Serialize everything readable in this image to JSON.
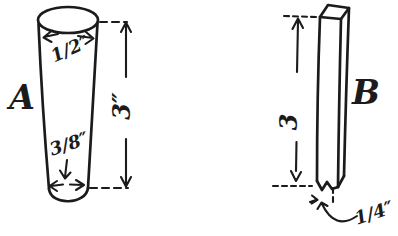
{
  "canvas": {
    "background": "#ffffff",
    "ink_color": "#1b1b1b"
  },
  "figure_a": {
    "label": "A",
    "top_diameter": "1/2″",
    "height": "3″",
    "bottom_diameter": "3/8″"
  },
  "figure_b": {
    "label": "B",
    "height": "3",
    "width": "1/4″"
  }
}
